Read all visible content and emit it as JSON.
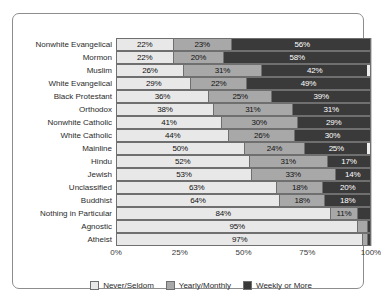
{
  "chart_data": {
    "type": "bar",
    "orientation": "horizontal",
    "stacked": true,
    "stack_mode": "percent",
    "title": "",
    "subtitle": "",
    "xlabel": "",
    "ylabel": "",
    "xlim": [
      0,
      100
    ],
    "xticks": [
      "0%",
      "25%",
      "50%",
      "75%",
      "100%"
    ],
    "xtick_values": [
      0,
      25,
      50,
      75,
      100
    ],
    "grid": true,
    "legend_position": "bottom",
    "categories": [
      "Nonwhite Evangelical",
      "Mormon",
      "Muslim",
      "White Evangelical",
      "Black Protestant",
      "Orthodox",
      "Nonwhite Catholic",
      "White Catholic",
      "Mainline",
      "Hindu",
      "Jewish",
      "Unclassified",
      "Buddhist",
      "Nothing in Particular",
      "Agnostic",
      "Atheist"
    ],
    "series": [
      {
        "name": "Never/Seldom",
        "color": "#e8e8e8",
        "values": [
          22,
          22,
          26,
          29,
          36,
          38,
          41,
          44,
          50,
          52,
          53,
          63,
          64,
          84,
          95,
          97
        ],
        "labels": [
          "22%",
          "22%",
          "26%",
          "29%",
          "36%",
          "38%",
          "41%",
          "44%",
          "50%",
          "52%",
          "53%",
          "63%",
          "64%",
          "84%",
          "95%",
          "97%"
        ]
      },
      {
        "name": "Yearly/Monthly",
        "color": "#a8a8a8",
        "values": [
          23,
          20,
          31,
          22,
          25,
          31,
          30,
          26,
          24,
          31,
          33,
          18,
          18,
          11,
          4,
          2
        ],
        "labels": [
          "23%",
          "20%",
          "31%",
          "22%",
          "25%",
          "31%",
          "30%",
          "26%",
          "24%",
          "31%",
          "33%",
          "18%",
          "18%",
          "11%",
          "",
          ""
        ]
      },
      {
        "name": "Weekly or More",
        "color": "#3a3a3a",
        "values": [
          56,
          58,
          42,
          49,
          39,
          31,
          29,
          30,
          25,
          17,
          14,
          20,
          18,
          5,
          1,
          1
        ],
        "labels": [
          "56%",
          "58%",
          "42%",
          "49%",
          "39%",
          "31%",
          "29%",
          "30%",
          "25%",
          "17%",
          "14%",
          "20%",
          "18%",
          "",
          "",
          ""
        ]
      }
    ]
  },
  "legend": {
    "items": [
      {
        "label": "Never/Seldom"
      },
      {
        "label": "Yearly/Monthly"
      },
      {
        "label": "Weekly or More"
      }
    ]
  }
}
